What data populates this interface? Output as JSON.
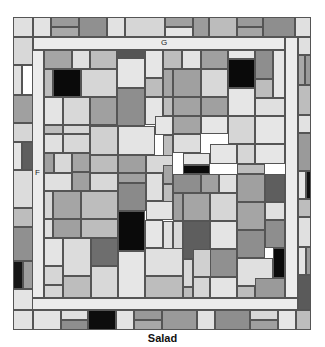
{
  "caption": "Salad",
  "labels": {
    "top_corridor": "G",
    "left_corridor": "F"
  },
  "colors": {
    "white": "#ffffff",
    "very_light": "#e8e8e8",
    "light": "#d4d4d4",
    "mid_light": "#bdbdbd",
    "mid": "#a3a3a3",
    "mid_dark": "#8c8c8c",
    "dark": "#666666",
    "black": "#0a0a0a",
    "line": "#555555"
  },
  "tiles": [
    {
      "x": 13,
      "y": 17,
      "w": 20,
      "h": 20,
      "fill": "#e0e0e0"
    },
    {
      "x": 33,
      "y": 17,
      "w": 18,
      "h": 20,
      "fill": "#e3e3e3"
    },
    {
      "x": 51,
      "y": 17,
      "w": 28,
      "h": 10,
      "fill": "#9a9a9a"
    },
    {
      "x": 51,
      "y": 27,
      "w": 28,
      "h": 10,
      "fill": "#a8a8a8"
    },
    {
      "x": 79,
      "y": 17,
      "w": 28,
      "h": 20,
      "fill": "#909090"
    },
    {
      "x": 107,
      "y": 17,
      "w": 18,
      "h": 20,
      "fill": "#e2e2e2"
    },
    {
      "x": 125,
      "y": 17,
      "w": 40,
      "h": 20,
      "fill": "#d6d6d6"
    },
    {
      "x": 165,
      "y": 17,
      "w": 28,
      "h": 10,
      "fill": "#a0a0a0"
    },
    {
      "x": 165,
      "y": 27,
      "w": 28,
      "h": 10,
      "fill": "#e6e6e6"
    },
    {
      "x": 193,
      "y": 17,
      "w": 16,
      "h": 20,
      "fill": "#9c9c9c"
    },
    {
      "x": 209,
      "y": 17,
      "w": 28,
      "h": 20,
      "fill": "#bcbcbc"
    },
    {
      "x": 237,
      "y": 17,
      "w": 26,
      "h": 10,
      "fill": "#9a9a9a"
    },
    {
      "x": 237,
      "y": 27,
      "w": 26,
      "h": 10,
      "fill": "#a5a5a5"
    },
    {
      "x": 263,
      "y": 17,
      "w": 32,
      "h": 20,
      "fill": "#8e8e8e"
    },
    {
      "x": 295,
      "y": 17,
      "w": 16,
      "h": 20,
      "fill": "#e0e0e0"
    },
    {
      "x": 33,
      "y": 37,
      "w": 252,
      "h": 13,
      "fill": "#ececec"
    },
    {
      "x": 285,
      "y": 37,
      "w": 13,
      "h": 261,
      "fill": "#ececec"
    },
    {
      "x": 32,
      "y": 50,
      "w": 12,
      "h": 248,
      "fill": "#ececec"
    },
    {
      "x": 32,
      "y": 298,
      "w": 266,
      "h": 12,
      "fill": "#ececec"
    },
    {
      "x": 13,
      "y": 37,
      "w": 20,
      "h": 28,
      "fill": "#d8d8d8"
    },
    {
      "x": 13,
      "y": 65,
      "w": 9,
      "h": 30,
      "fill": "#e0e0e0"
    },
    {
      "x": 22,
      "y": 65,
      "w": 11,
      "h": 30,
      "fill": "#ffffff"
    },
    {
      "x": 13,
      "y": 95,
      "w": 20,
      "h": 28,
      "fill": "#a0a0a0"
    },
    {
      "x": 13,
      "y": 123,
      "w": 20,
      "h": 19,
      "fill": "#d6d6d6"
    },
    {
      "x": 13,
      "y": 142,
      "w": 9,
      "h": 28,
      "fill": "#e4e4e4"
    },
    {
      "x": 22,
      "y": 142,
      "w": 11,
      "h": 28,
      "fill": "#5e5e5e"
    },
    {
      "x": 13,
      "y": 170,
      "w": 20,
      "h": 38,
      "fill": "#dcdcdc"
    },
    {
      "x": 13,
      "y": 208,
      "w": 20,
      "h": 19,
      "fill": "#bdbdbd"
    },
    {
      "x": 13,
      "y": 227,
      "w": 20,
      "h": 34,
      "fill": "#909090"
    },
    {
      "x": 13,
      "y": 261,
      "w": 10,
      "h": 28,
      "fill": "#151515"
    },
    {
      "x": 23,
      "y": 261,
      "w": 10,
      "h": 28,
      "fill": "#9e9e9e"
    },
    {
      "x": 13,
      "y": 289,
      "w": 20,
      "h": 21,
      "fill": "#e4e4e4"
    },
    {
      "x": 298,
      "y": 37,
      "w": 13,
      "h": 18,
      "fill": "#e0e0e0"
    },
    {
      "x": 298,
      "y": 55,
      "w": 7,
      "h": 30,
      "fill": "#a8a8a8"
    },
    {
      "x": 305,
      "y": 55,
      "w": 6,
      "h": 30,
      "fill": "#9a9a9a"
    },
    {
      "x": 298,
      "y": 85,
      "w": 13,
      "h": 30,
      "fill": "#bdbdbd"
    },
    {
      "x": 298,
      "y": 115,
      "w": 13,
      "h": 18,
      "fill": "#e2e2e2"
    },
    {
      "x": 298,
      "y": 133,
      "w": 13,
      "h": 38,
      "fill": "#9a9a9a"
    },
    {
      "x": 298,
      "y": 171,
      "w": 8,
      "h": 28,
      "fill": "#e4e4e4"
    },
    {
      "x": 306,
      "y": 171,
      "w": 5,
      "h": 28,
      "fill": "#0f0f0f"
    },
    {
      "x": 298,
      "y": 199,
      "w": 13,
      "h": 18,
      "fill": "#bdbdbd"
    },
    {
      "x": 298,
      "y": 217,
      "w": 13,
      "h": 30,
      "fill": "#e0e0e0"
    },
    {
      "x": 298,
      "y": 247,
      "w": 8,
      "h": 28,
      "fill": "#e4e4e4"
    },
    {
      "x": 306,
      "y": 247,
      "w": 5,
      "h": 28,
      "fill": "#9a9a9a"
    },
    {
      "x": 298,
      "y": 275,
      "w": 13,
      "h": 35,
      "fill": "#5a5a5a"
    },
    {
      "x": 13,
      "y": 310,
      "w": 20,
      "h": 20,
      "fill": "#e2e2e2"
    },
    {
      "x": 33,
      "y": 310,
      "w": 28,
      "h": 20,
      "fill": "#e4e4e4"
    },
    {
      "x": 61,
      "y": 310,
      "w": 27,
      "h": 10,
      "fill": "#e0e0e0"
    },
    {
      "x": 61,
      "y": 320,
      "w": 27,
      "h": 10,
      "fill": "#8e8e8e"
    },
    {
      "x": 88,
      "y": 310,
      "w": 28,
      "h": 20,
      "fill": "#0d0d0d"
    },
    {
      "x": 116,
      "y": 310,
      "w": 18,
      "h": 20,
      "fill": "#e4e4e4"
    },
    {
      "x": 134,
      "y": 310,
      "w": 28,
      "h": 10,
      "fill": "#999999"
    },
    {
      "x": 134,
      "y": 320,
      "w": 28,
      "h": 10,
      "fill": "#a8a8a8"
    },
    {
      "x": 162,
      "y": 310,
      "w": 35,
      "h": 20,
      "fill": "#9a9a9a"
    },
    {
      "x": 197,
      "y": 310,
      "w": 18,
      "h": 20,
      "fill": "#e2e2e2"
    },
    {
      "x": 215,
      "y": 310,
      "w": 35,
      "h": 20,
      "fill": "#8e8e8e"
    },
    {
      "x": 250,
      "y": 310,
      "w": 28,
      "h": 10,
      "fill": "#d8d8d8"
    },
    {
      "x": 250,
      "y": 320,
      "w": 28,
      "h": 10,
      "fill": "#a0a0a0"
    },
    {
      "x": 278,
      "y": 310,
      "w": 18,
      "h": 20,
      "fill": "#e6e6e6"
    },
    {
      "x": 296,
      "y": 310,
      "w": 15,
      "h": 20,
      "fill": "#bdbdbd"
    },
    {
      "x": 44,
      "y": 50,
      "w": 28,
      "h": 19,
      "fill": "#a5a5a5"
    },
    {
      "x": 72,
      "y": 50,
      "w": 18,
      "h": 19,
      "fill": "#e0e0e0"
    },
    {
      "x": 90,
      "y": 50,
      "w": 27,
      "h": 19,
      "fill": "#bdbdbd"
    },
    {
      "x": 117,
      "y": 50,
      "w": 28,
      "h": 8,
      "fill": "#555555"
    },
    {
      "x": 117,
      "y": 58,
      "w": 28,
      "h": 30,
      "fill": "#e6e6e6"
    },
    {
      "x": 145,
      "y": 50,
      "w": 18,
      "h": 28,
      "fill": "#e6e6e6"
    },
    {
      "x": 163,
      "y": 50,
      "w": 19,
      "h": 19,
      "fill": "#bdbdbd"
    },
    {
      "x": 182,
      "y": 50,
      "w": 19,
      "h": 19,
      "fill": "#e4e4e4"
    },
    {
      "x": 201,
      "y": 50,
      "w": 27,
      "h": 19,
      "fill": "#a0a0a0"
    },
    {
      "x": 228,
      "y": 50,
      "w": 27,
      "h": 9,
      "fill": "#e6e6e6"
    },
    {
      "x": 228,
      "y": 59,
      "w": 27,
      "h": 29,
      "fill": "#0a0a0a"
    },
    {
      "x": 255,
      "y": 50,
      "w": 18,
      "h": 29,
      "fill": "#8e8e8e"
    },
    {
      "x": 273,
      "y": 50,
      "w": 12,
      "h": 48,
      "fill": "#e6e6e6"
    },
    {
      "x": 44,
      "y": 69,
      "w": 9,
      "h": 28,
      "fill": "#bdbdbd"
    },
    {
      "x": 53,
      "y": 69,
      "w": 28,
      "h": 28,
      "fill": "#0a0a0a"
    },
    {
      "x": 81,
      "y": 69,
      "w": 36,
      "h": 28,
      "fill": "#d6d6d6"
    },
    {
      "x": 145,
      "y": 78,
      "w": 18,
      "h": 19,
      "fill": "#bdbdbd"
    },
    {
      "x": 163,
      "y": 69,
      "w": 10,
      "h": 28,
      "fill": "#a5a5a5"
    },
    {
      "x": 173,
      "y": 69,
      "w": 28,
      "h": 28,
      "fill": "#a0a0a0"
    },
    {
      "x": 201,
      "y": 69,
      "w": 27,
      "h": 28,
      "fill": "#d8d8d8"
    },
    {
      "x": 255,
      "y": 79,
      "w": 18,
      "h": 19,
      "fill": "#bdbdbd"
    },
    {
      "x": 117,
      "y": 88,
      "w": 28,
      "h": 38,
      "fill": "#8e8e8e"
    },
    {
      "x": 228,
      "y": 88,
      "w": 27,
      "h": 28,
      "fill": "#e6e6e6"
    },
    {
      "x": 44,
      "y": 97,
      "w": 19,
      "h": 28,
      "fill": "#e4e4e4"
    },
    {
      "x": 63,
      "y": 97,
      "w": 27,
      "h": 28,
      "fill": "#d8d8d8"
    },
    {
      "x": 90,
      "y": 97,
      "w": 27,
      "h": 28,
      "fill": "#a0a0a0"
    },
    {
      "x": 145,
      "y": 97,
      "w": 18,
      "h": 28,
      "fill": "#e6e6e6"
    },
    {
      "x": 163,
      "y": 97,
      "w": 10,
      "h": 19,
      "fill": "#bdbdbd"
    },
    {
      "x": 173,
      "y": 97,
      "w": 28,
      "h": 19,
      "fill": "#a3a3a3"
    },
    {
      "x": 201,
      "y": 97,
      "w": 27,
      "h": 19,
      "fill": "#a0a0a0"
    },
    {
      "x": 255,
      "y": 98,
      "w": 30,
      "h": 18,
      "fill": "#e0e0e0"
    },
    {
      "x": 44,
      "y": 125,
      "w": 19,
      "h": 9,
      "fill": "#bdbdbd"
    },
    {
      "x": 63,
      "y": 125,
      "w": 27,
      "h": 9,
      "fill": "#d6d6d6"
    },
    {
      "x": 90,
      "y": 125,
      "w": 28,
      "h": 9,
      "fill": "#a0a0a0"
    },
    {
      "x": 44,
      "y": 134,
      "w": 19,
      "h": 19,
      "fill": "#e0e0e0"
    },
    {
      "x": 63,
      "y": 134,
      "w": 27,
      "h": 19,
      "fill": "#d8d8d8"
    },
    {
      "x": 90,
      "y": 126,
      "w": 28,
      "h": 29,
      "fill": "#d0d0d0"
    },
    {
      "x": 118,
      "y": 126,
      "w": 37,
      "h": 29,
      "fill": "#e4e4e4"
    },
    {
      "x": 155,
      "y": 116,
      "w": 18,
      "h": 19,
      "fill": "#e6e6e6"
    },
    {
      "x": 163,
      "y": 135,
      "w": 10,
      "h": 30,
      "fill": "#bdbdbd"
    },
    {
      "x": 173,
      "y": 116,
      "w": 28,
      "h": 18,
      "fill": "#a5a5a5"
    },
    {
      "x": 173,
      "y": 134,
      "w": 28,
      "h": 19,
      "fill": "#dedede"
    },
    {
      "x": 201,
      "y": 116,
      "w": 27,
      "h": 18,
      "fill": "#e6e6e6"
    },
    {
      "x": 228,
      "y": 116,
      "w": 27,
      "h": 28,
      "fill": "#d6d6d6"
    },
    {
      "x": 255,
      "y": 116,
      "w": 30,
      "h": 28,
      "fill": "#e6e6e6"
    },
    {
      "x": 44,
      "y": 153,
      "w": 10,
      "h": 20,
      "fill": "#a0a0a0"
    },
    {
      "x": 54,
      "y": 153,
      "w": 18,
      "h": 20,
      "fill": "#d8d8d8"
    },
    {
      "x": 72,
      "y": 153,
      "w": 18,
      "h": 19,
      "fill": "#a5a5a5"
    },
    {
      "x": 90,
      "y": 155,
      "w": 28,
      "h": 18,
      "fill": "#bdbdbd"
    },
    {
      "x": 118,
      "y": 155,
      "w": 28,
      "h": 18,
      "fill": "#a0a0a0"
    },
    {
      "x": 146,
      "y": 155,
      "w": 27,
      "h": 18,
      "fill": "#d8d8d8"
    },
    {
      "x": 163,
      "y": 165,
      "w": 10,
      "h": 19,
      "fill": "#a5a5a5"
    },
    {
      "x": 183,
      "y": 165,
      "w": 27,
      "h": 9,
      "fill": "#0a0a0a"
    },
    {
      "x": 183,
      "y": 153,
      "w": 27,
      "h": 12,
      "fill": "#e4e4e4"
    },
    {
      "x": 210,
      "y": 144,
      "w": 27,
      "h": 20,
      "fill": "#e6e6e6"
    },
    {
      "x": 237,
      "y": 144,
      "w": 18,
      "h": 20,
      "fill": "#d6d6d6"
    },
    {
      "x": 255,
      "y": 144,
      "w": 30,
      "h": 20,
      "fill": "#e6e6e6"
    },
    {
      "x": 44,
      "y": 173,
      "w": 28,
      "h": 18,
      "fill": "#e0e0e0"
    },
    {
      "x": 72,
      "y": 172,
      "w": 18,
      "h": 19,
      "fill": "#a0a0a0"
    },
    {
      "x": 90,
      "y": 173,
      "w": 28,
      "h": 18,
      "fill": "#d8d8d8"
    },
    {
      "x": 118,
      "y": 173,
      "w": 28,
      "h": 10,
      "fill": "#a0a0a0"
    },
    {
      "x": 118,
      "y": 183,
      "w": 28,
      "h": 28,
      "fill": "#8a8a8a"
    },
    {
      "x": 146,
      "y": 173,
      "w": 17,
      "h": 28,
      "fill": "#e0e0e0"
    },
    {
      "x": 163,
      "y": 184,
      "w": 10,
      "h": 19,
      "fill": "#bdbdbd"
    },
    {
      "x": 173,
      "y": 174,
      "w": 28,
      "h": 19,
      "fill": "#8e8e8e"
    },
    {
      "x": 201,
      "y": 174,
      "w": 18,
      "h": 19,
      "fill": "#a0a0a0"
    },
    {
      "x": 219,
      "y": 174,
      "w": 18,
      "h": 19,
      "fill": "#e0e0e0"
    },
    {
      "x": 237,
      "y": 164,
      "w": 28,
      "h": 10,
      "fill": "#bdbdbd"
    },
    {
      "x": 237,
      "y": 174,
      "w": 28,
      "h": 28,
      "fill": "#a0a0a0"
    },
    {
      "x": 265,
      "y": 174,
      "w": 20,
      "h": 28,
      "fill": "#5e5e5e"
    },
    {
      "x": 44,
      "y": 191,
      "w": 9,
      "h": 28,
      "fill": "#d6d6d6"
    },
    {
      "x": 53,
      "y": 191,
      "w": 28,
      "h": 28,
      "fill": "#a5a5a5"
    },
    {
      "x": 81,
      "y": 191,
      "w": 37,
      "h": 28,
      "fill": "#bdbdbd"
    },
    {
      "x": 146,
      "y": 201,
      "w": 27,
      "h": 19,
      "fill": "#e4e4e4"
    },
    {
      "x": 173,
      "y": 193,
      "w": 10,
      "h": 28,
      "fill": "#a0a0a0"
    },
    {
      "x": 183,
      "y": 193,
      "w": 27,
      "h": 28,
      "fill": "#a5a5a5"
    },
    {
      "x": 210,
      "y": 193,
      "w": 27,
      "h": 28,
      "fill": "#d6d6d6"
    },
    {
      "x": 237,
      "y": 202,
      "w": 28,
      "h": 28,
      "fill": "#a5a5a5"
    },
    {
      "x": 265,
      "y": 202,
      "w": 20,
      "h": 18,
      "fill": "#e0e0e0"
    },
    {
      "x": 44,
      "y": 219,
      "w": 9,
      "h": 19,
      "fill": "#e0e0e0"
    },
    {
      "x": 53,
      "y": 219,
      "w": 28,
      "h": 19,
      "fill": "#a0a0a0"
    },
    {
      "x": 81,
      "y": 219,
      "w": 37,
      "h": 19,
      "fill": "#bdbdbd"
    },
    {
      "x": 118,
      "y": 211,
      "w": 27,
      "h": 40,
      "fill": "#0a0a0a"
    },
    {
      "x": 145,
      "y": 220,
      "w": 18,
      "h": 28,
      "fill": "#e6e6e6"
    },
    {
      "x": 163,
      "y": 221,
      "w": 10,
      "h": 28,
      "fill": "#e0e0e0"
    },
    {
      "x": 173,
      "y": 221,
      "w": 10,
      "h": 28,
      "fill": "#d8d8d8"
    },
    {
      "x": 183,
      "y": 221,
      "w": 27,
      "h": 38,
      "fill": "#5e5e5e"
    },
    {
      "x": 210,
      "y": 221,
      "w": 27,
      "h": 28,
      "fill": "#e4e4e4"
    },
    {
      "x": 237,
      "y": 230,
      "w": 28,
      "h": 28,
      "fill": "#8e8e8e"
    },
    {
      "x": 265,
      "y": 220,
      "w": 20,
      "h": 28,
      "fill": "#8e8e8e"
    },
    {
      "x": 44,
      "y": 238,
      "w": 19,
      "h": 28,
      "fill": "#e4e4e4"
    },
    {
      "x": 63,
      "y": 238,
      "w": 28,
      "h": 38,
      "fill": "#dcdcdc"
    },
    {
      "x": 91,
      "y": 238,
      "w": 27,
      "h": 28,
      "fill": "#6e6e6e"
    },
    {
      "x": 145,
      "y": 248,
      "w": 38,
      "h": 28,
      "fill": "#e0e0e0"
    },
    {
      "x": 183,
      "y": 259,
      "w": 10,
      "h": 28,
      "fill": "#d8d8d8"
    },
    {
      "x": 193,
      "y": 249,
      "w": 27,
      "h": 28,
      "fill": "#d0d0d0"
    },
    {
      "x": 220,
      "y": 249,
      "w": 17,
      "h": 28,
      "fill": "#d8d8d8"
    },
    {
      "x": 237,
      "y": 258,
      "w": 36,
      "h": 28,
      "fill": "#e0e0e0"
    },
    {
      "x": 273,
      "y": 248,
      "w": 12,
      "h": 30,
      "fill": "#0a0a0a"
    },
    {
      "x": 210,
      "y": 249,
      "w": 27,
      "h": 28,
      "fill": "#909090"
    },
    {
      "x": 44,
      "y": 266,
      "w": 19,
      "h": 19,
      "fill": "#d6d6d6"
    },
    {
      "x": 44,
      "y": 285,
      "w": 19,
      "h": 13,
      "fill": "#d6d6d6"
    },
    {
      "x": 63,
      "y": 276,
      "w": 28,
      "h": 22,
      "fill": "#bdbdbd"
    },
    {
      "x": 91,
      "y": 266,
      "w": 27,
      "h": 32,
      "fill": "#d8d8d8"
    },
    {
      "x": 118,
      "y": 251,
      "w": 27,
      "h": 47,
      "fill": "#e6e6e6"
    },
    {
      "x": 145,
      "y": 276,
      "w": 38,
      "h": 22,
      "fill": "#bdbdbd"
    },
    {
      "x": 183,
      "y": 287,
      "w": 10,
      "h": 11,
      "fill": "#bdbdbd"
    },
    {
      "x": 193,
      "y": 277,
      "w": 17,
      "h": 21,
      "fill": "#d6d6d6"
    },
    {
      "x": 210,
      "y": 277,
      "w": 27,
      "h": 21,
      "fill": "#e4e4e4"
    },
    {
      "x": 237,
      "y": 286,
      "w": 18,
      "h": 12,
      "fill": "#bdbdbd"
    },
    {
      "x": 255,
      "y": 278,
      "w": 30,
      "h": 20,
      "fill": "#9a9a9a"
    }
  ]
}
